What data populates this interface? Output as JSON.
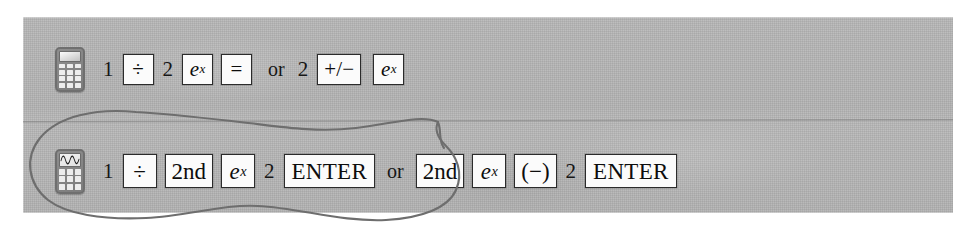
{
  "figure": {
    "panel_color": "#b4b4b4",
    "key_fill_color": "#fbfbfb",
    "key_border_color": "#2b2b2b",
    "annotation_color": "#6b6b6b"
  },
  "rows": [
    {
      "id": "basic-calculator-row",
      "icon": {
        "name": "basic-calculator-icon",
        "type": "basic",
        "screen_label": "",
        "key_rows": 4,
        "key_cols": 3
      },
      "sequence_1": {
        "label": "e to the one half via divide",
        "tokens": [
          {
            "kind": "text",
            "text": "1"
          },
          {
            "kind": "key",
            "text": "÷"
          },
          {
            "kind": "text",
            "text": "2"
          },
          {
            "kind": "key",
            "text": "e^x",
            "base": "e",
            "exponent": "x"
          },
          {
            "kind": "key",
            "text": "="
          }
        ]
      },
      "connector": "or",
      "sequence_2": {
        "label": "e to the minus two via plus minus",
        "tokens": [
          {
            "kind": "text",
            "text": "2"
          },
          {
            "kind": "key",
            "text": "+/−"
          },
          {
            "kind": "key",
            "text": "e^x",
            "base": "e",
            "exponent": "x"
          }
        ]
      }
    },
    {
      "id": "graphing-calculator-row",
      "icon": {
        "name": "graphing-calculator-icon",
        "type": "graphing",
        "screen_label": "sine-wave",
        "key_rows": 3,
        "key_cols": 3
      },
      "sequence_1": {
        "label": "e to the one half via divide 2nd",
        "tokens": [
          {
            "kind": "text",
            "text": "1"
          },
          {
            "kind": "key",
            "text": "÷"
          },
          {
            "kind": "key",
            "text": "2nd"
          },
          {
            "kind": "key",
            "text": "e^x",
            "base": "e",
            "exponent": "x"
          },
          {
            "kind": "text",
            "text": "2"
          },
          {
            "kind": "key",
            "text": "ENTER"
          }
        ]
      },
      "connector": "or",
      "sequence_2": {
        "label": "e to the minus two via negate",
        "tokens": [
          {
            "kind": "key",
            "text": "2nd"
          },
          {
            "kind": "key",
            "text": "e^x",
            "base": "e",
            "exponent": "x"
          },
          {
            "kind": "key",
            "text": "(−)"
          },
          {
            "kind": "text",
            "text": "2"
          },
          {
            "kind": "key",
            "text": "ENTER"
          }
        ]
      }
    }
  ],
  "annotation": {
    "name": "hand-drawn-oval",
    "shape": "oval",
    "encircles": "graphing-calculator-row first keystroke sequence",
    "color": "#6b6b6b"
  }
}
